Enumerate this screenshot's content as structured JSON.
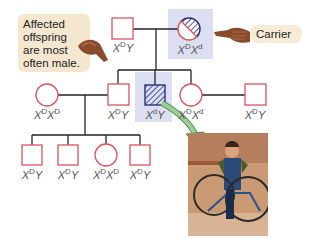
{
  "callout": {
    "text_lines": [
      "Affected",
      "offspring",
      "are most",
      "often male."
    ]
  },
  "carrier_tag": {
    "label": "Carrier"
  },
  "colors": {
    "unaffected_stroke": "#d9545e",
    "affected_stroke": "#2b2f7a",
    "highlight": "#dcdff2",
    "callout_bg": "#f5e6d0",
    "arrow": "#7fb77e"
  },
  "generation_1": {
    "father": {
      "sex": "male",
      "status": "unaffected",
      "genotype_base": "X",
      "allele1": "D",
      "second": "Y"
    },
    "mother": {
      "sex": "female",
      "status": "carrier",
      "genotype_base": "X",
      "allele1": "D",
      "second_base": "X",
      "allele2": "d"
    }
  },
  "generation_2": [
    {
      "sex": "female",
      "status": "unaffected",
      "allele1": "D",
      "second_base": "X",
      "allele2": "D",
      "role": "spouse"
    },
    {
      "sex": "male",
      "status": "unaffected",
      "allele1": "D",
      "second": "Y"
    },
    {
      "sex": "male",
      "status": "affected",
      "allele1": "d",
      "second": "Y"
    },
    {
      "sex": "female",
      "status": "unaffected",
      "allele1": "D",
      "second_base": "X",
      "allele2": "d"
    },
    {
      "sex": "male",
      "status": "unaffected",
      "allele1": "D",
      "second": "Y",
      "role": "spouse"
    }
  ],
  "generation_3": [
    {
      "sex": "male",
      "allele1": "D",
      "second": "Y"
    },
    {
      "sex": "male",
      "allele1": "D",
      "second": "Y"
    },
    {
      "sex": "female",
      "allele1": "D",
      "second_base": "X",
      "allele2": "D"
    },
    {
      "sex": "male",
      "allele1": "D",
      "second": "Y"
    }
  ],
  "photo": {
    "description": "boy in a wheeled walker frame"
  },
  "icons": {
    "pointer_left": "hand-pointer-icon",
    "pointer_right": "hand-pointer-icon"
  }
}
